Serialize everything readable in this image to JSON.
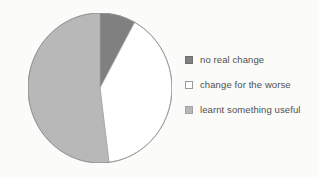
{
  "chart_data": {
    "type": "pie",
    "title": "",
    "categories": [
      "no real change",
      "change for the worse",
      "learnt something useful"
    ],
    "values": [
      8,
      40,
      52
    ],
    "unit": "percent",
    "colors": [
      "#808080",
      "#ffffff",
      "#b8b8b8"
    ],
    "start_angle_deg": 0,
    "direction": "clockwise",
    "legend_position": "right",
    "grid": false,
    "labels_shown": false,
    "xlabel": "",
    "ylabel": ""
  },
  "legend": {
    "items": [
      {
        "label": "no real change",
        "swatch_color": "#808080",
        "swatch_border": "#6e6e6e"
      },
      {
        "label": "change for the worse",
        "swatch_color": "#ffffff",
        "swatch_border": "#9a9a9a"
      },
      {
        "label": "learnt something useful",
        "swatch_color": "#b8b8b8",
        "swatch_border": "#a2a2a2"
      }
    ]
  },
  "pie": {
    "outline_color": "#8c8c8c",
    "background": "#fbfbf9"
  }
}
